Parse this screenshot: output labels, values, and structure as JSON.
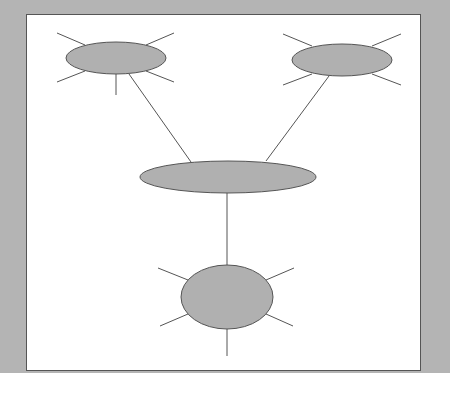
{
  "diagram": {
    "type": "hub-network",
    "colors": {
      "frame": "#b4b4b4",
      "panel": "#ffffff",
      "node_fill": "#b0b0b0",
      "stroke": "#555555"
    },
    "nodes": [
      {
        "id": "top-left",
        "cx": 116,
        "cy": 58,
        "rx": 50,
        "ry": 16,
        "spokes": [
          [
            57,
            33,
            85,
            45
          ],
          [
            146,
            45,
            174,
            33
          ],
          [
            57,
            82,
            85,
            71
          ],
          [
            146,
            71,
            174,
            82
          ],
          [
            116,
            74,
            116,
            95
          ]
        ]
      },
      {
        "id": "top-right",
        "cx": 342,
        "cy": 60,
        "rx": 50,
        "ry": 16,
        "spokes": [
          [
            283,
            34,
            312,
            46
          ],
          [
            372,
            46,
            401,
            34
          ],
          [
            283,
            85,
            312,
            74
          ],
          [
            372,
            74,
            401,
            85
          ]
        ]
      },
      {
        "id": "center-hub",
        "cx": 228,
        "cy": 177,
        "rx": 88,
        "ry": 16,
        "spokes": []
      },
      {
        "id": "bottom",
        "cx": 227,
        "cy": 297,
        "rx": 46,
        "ry": 32,
        "spokes": [
          [
            158,
            268,
            188,
            280
          ],
          [
            266,
            280,
            294,
            268
          ],
          [
            160,
            326,
            188,
            314
          ],
          [
            266,
            314,
            293,
            326
          ],
          [
            227,
            329,
            227,
            356
          ]
        ]
      }
    ],
    "edges": [
      {
        "from": "top-left",
        "to": "center-hub",
        "line": [
          129,
          74,
          191,
          162
        ]
      },
      {
        "from": "top-right",
        "to": "center-hub",
        "line": [
          329,
          76,
          266,
          161
        ]
      },
      {
        "from": "center-hub",
        "to": "bottom",
        "line": [
          227,
          193,
          227,
          265
        ]
      }
    ]
  }
}
